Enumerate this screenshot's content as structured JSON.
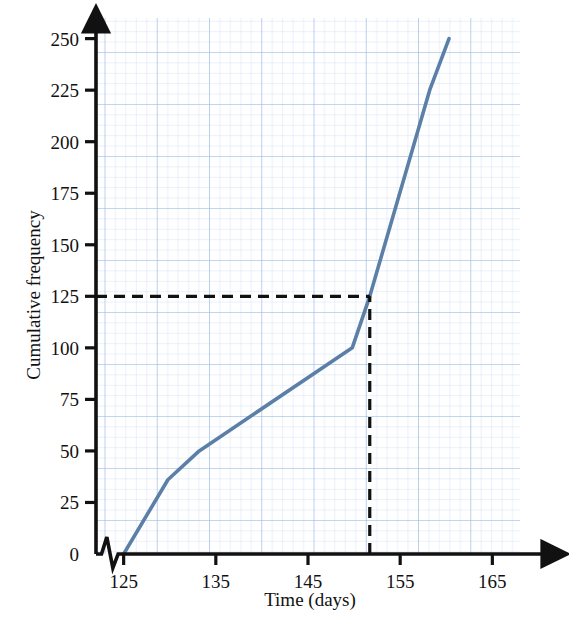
{
  "chart_data": {
    "type": "line",
    "title": "",
    "xlabel": "Time (days)",
    "ylabel": "Cumulative frequency",
    "xlim": [
      122,
      168
    ],
    "ylim": [
      0,
      260
    ],
    "xticks": [
      125,
      135,
      145,
      155,
      165
    ],
    "yticks": [
      0,
      25,
      50,
      75,
      100,
      125,
      150,
      175,
      200,
      225,
      250
    ],
    "grid": true,
    "grid_color": "#a9c2e8",
    "grid_minor_color": "#cfdef5",
    "legend": "none",
    "axis_break": {
      "axis": "x",
      "symbol": "zigzag",
      "between": [
        122.6,
        124.4
      ]
    },
    "series": [
      {
        "name": "Cumulative frequency",
        "color": "#5c7fa8",
        "x": [
          125,
          129.8,
          133.2,
          149.8,
          151.7,
          158.2,
          160.3
        ],
        "y": [
          0,
          36,
          50,
          100,
          125,
          225,
          250
        ],
        "points": [
          {
            "x": 125,
            "y": 0
          },
          {
            "x": 129.8,
            "y": 36
          },
          {
            "x": 133.2,
            "y": 50
          },
          {
            "x": 149.8,
            "y": 100
          },
          {
            "x": 151.7,
            "y": 125
          },
          {
            "x": 158.2,
            "y": 225
          },
          {
            "x": 160.3,
            "y": 250
          }
        ]
      }
    ],
    "annotations": [
      {
        "name": "median-construction-lines",
        "style": "dashed",
        "color": "#111111",
        "horizontal": {
          "y": 125,
          "from_x": 122,
          "to_x": 151.7
        },
        "vertical": {
          "x": 151.7,
          "from_y": 0,
          "to_y": 125
        }
      }
    ]
  },
  "axes": {
    "y_label": "Cumulative frequency",
    "x_label": "Time (days)",
    "y_tick_labels": [
      "250",
      "225",
      "200",
      "175",
      "150",
      "125",
      "100",
      "75",
      "50",
      "25",
      "0"
    ],
    "x_tick_labels": [
      "125",
      "135",
      "145",
      "155",
      "165"
    ]
  }
}
